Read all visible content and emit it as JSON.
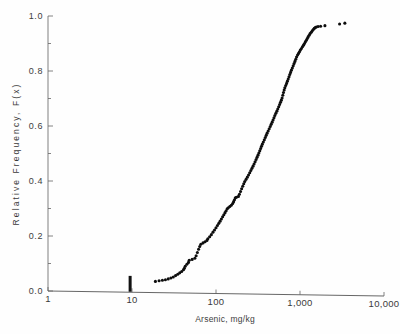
{
  "chart_data": {
    "type": "scatter",
    "title": "",
    "subtitle": "",
    "xlabel": "Arsenic, mg/kg",
    "ylabel": "Relative Frequency, F(x)",
    "xscale": "log",
    "yscale": "linear",
    "xlim": [
      1,
      10000
    ],
    "ylim": [
      0.0,
      1.0
    ],
    "grid": false,
    "legend": null,
    "xticks": [
      {
        "value": 1,
        "label": "1"
      },
      {
        "value": 10,
        "label": "10"
      },
      {
        "value": 100,
        "label": "100"
      },
      {
        "value": 1000,
        "label": "1,000"
      },
      {
        "value": 10000,
        "label": "10,000"
      }
    ],
    "yticks": [
      {
        "value": 0.0,
        "label": "0.0"
      },
      {
        "value": 0.2,
        "label": "0.2"
      },
      {
        "value": 0.4,
        "label": "0.4"
      },
      {
        "value": 0.6,
        "label": "0.6"
      },
      {
        "value": 0.8,
        "label": "0.8"
      },
      {
        "value": 1.0,
        "label": "1.0"
      }
    ],
    "yminorticks": [
      0.1,
      0.3,
      0.5,
      0.7,
      0.9
    ],
    "annotations": [
      {
        "name": "threshold-marker",
        "type": "vertical-bar",
        "x": 9.5,
        "y_from": 0.0,
        "y_to": 0.055,
        "label": ""
      }
    ],
    "series": [
      {
        "name": "Empirical CDF of arsenic concentration",
        "marker": "dot",
        "color": "#0d0d0d",
        "points": [
          [
            19,
            0.035
          ],
          [
            21,
            0.037
          ],
          [
            23,
            0.039
          ],
          [
            25,
            0.041
          ],
          [
            27,
            0.044
          ],
          [
            29,
            0.047
          ],
          [
            31,
            0.051
          ],
          [
            33,
            0.056
          ],
          [
            35,
            0.061
          ],
          [
            37,
            0.066
          ],
          [
            39,
            0.071
          ],
          [
            41,
            0.077
          ],
          [
            42,
            0.083
          ],
          [
            43,
            0.09
          ],
          [
            45,
            0.097
          ],
          [
            47,
            0.104
          ],
          [
            48,
            0.112
          ],
          [
            52,
            0.115
          ],
          [
            56,
            0.119
          ],
          [
            58,
            0.128
          ],
          [
            60,
            0.14
          ],
          [
            62,
            0.152
          ],
          [
            64,
            0.162
          ],
          [
            66,
            0.17
          ],
          [
            70,
            0.175
          ],
          [
            74,
            0.179
          ],
          [
            78,
            0.184
          ],
          [
            80,
            0.19
          ],
          [
            84,
            0.197
          ],
          [
            88,
            0.205
          ],
          [
            92,
            0.214
          ],
          [
            96,
            0.222
          ],
          [
            100,
            0.23
          ],
          [
            104,
            0.238
          ],
          [
            108,
            0.246
          ],
          [
            112,
            0.254
          ],
          [
            116,
            0.262
          ],
          [
            120,
            0.27
          ],
          [
            124,
            0.277
          ],
          [
            128,
            0.285
          ],
          [
            132,
            0.292
          ],
          [
            136,
            0.299
          ],
          [
            140,
            0.303
          ],
          [
            146,
            0.307
          ],
          [
            152,
            0.312
          ],
          [
            158,
            0.318
          ],
          [
            162,
            0.325
          ],
          [
            166,
            0.332
          ],
          [
            170,
            0.339
          ],
          [
            175,
            0.341
          ],
          [
            185,
            0.344
          ],
          [
            190,
            0.352
          ],
          [
            196,
            0.362
          ],
          [
            202,
            0.372
          ],
          [
            208,
            0.381
          ],
          [
            214,
            0.39
          ],
          [
            220,
            0.398
          ],
          [
            228,
            0.406
          ],
          [
            236,
            0.414
          ],
          [
            244,
            0.422
          ],
          [
            252,
            0.43
          ],
          [
            260,
            0.438
          ],
          [
            268,
            0.446
          ],
          [
            276,
            0.454
          ],
          [
            284,
            0.462
          ],
          [
            292,
            0.47
          ],
          [
            300,
            0.478
          ],
          [
            308,
            0.486
          ],
          [
            316,
            0.494
          ],
          [
            324,
            0.502
          ],
          [
            332,
            0.51
          ],
          [
            340,
            0.518
          ],
          [
            348,
            0.526
          ],
          [
            356,
            0.534
          ],
          [
            366,
            0.542
          ],
          [
            376,
            0.55
          ],
          [
            386,
            0.558
          ],
          [
            396,
            0.566
          ],
          [
            406,
            0.574
          ],
          [
            418,
            0.582
          ],
          [
            430,
            0.59
          ],
          [
            442,
            0.598
          ],
          [
            454,
            0.606
          ],
          [
            466,
            0.614
          ],
          [
            478,
            0.622
          ],
          [
            490,
            0.63
          ],
          [
            502,
            0.638
          ],
          [
            516,
            0.646
          ],
          [
            530,
            0.654
          ],
          [
            544,
            0.662
          ],
          [
            558,
            0.67
          ],
          [
            572,
            0.678
          ],
          [
            586,
            0.686
          ],
          [
            600,
            0.694
          ],
          [
            612,
            0.702
          ],
          [
            624,
            0.712
          ],
          [
            636,
            0.722
          ],
          [
            648,
            0.731
          ],
          [
            660,
            0.739
          ],
          [
            676,
            0.747
          ],
          [
            692,
            0.755
          ],
          [
            708,
            0.763
          ],
          [
            724,
            0.771
          ],
          [
            740,
            0.779
          ],
          [
            756,
            0.787
          ],
          [
            772,
            0.795
          ],
          [
            790,
            0.803
          ],
          [
            810,
            0.811
          ],
          [
            830,
            0.819
          ],
          [
            850,
            0.827
          ],
          [
            870,
            0.835
          ],
          [
            890,
            0.843
          ],
          [
            910,
            0.851
          ],
          [
            935,
            0.858
          ],
          [
            960,
            0.864
          ],
          [
            985,
            0.87
          ],
          [
            1010,
            0.876
          ],
          [
            1040,
            0.882
          ],
          [
            1070,
            0.888
          ],
          [
            1100,
            0.894
          ],
          [
            1130,
            0.9
          ],
          [
            1160,
            0.906
          ],
          [
            1190,
            0.912
          ],
          [
            1220,
            0.918
          ],
          [
            1250,
            0.924
          ],
          [
            1285,
            0.93
          ],
          [
            1320,
            0.936
          ],
          [
            1360,
            0.941
          ],
          [
            1400,
            0.946
          ],
          [
            1440,
            0.951
          ],
          [
            1480,
            0.955
          ],
          [
            1520,
            0.958
          ],
          [
            1560,
            0.96
          ],
          [
            1640,
            0.962
          ],
          [
            1760,
            0.963
          ],
          [
            1980,
            0.965
          ],
          [
            2960,
            0.971
          ],
          [
            3420,
            0.974
          ]
        ]
      }
    ]
  }
}
